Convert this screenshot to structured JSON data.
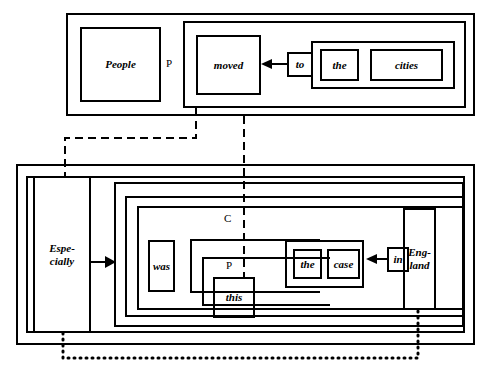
{
  "diagram": {
    "style": {
      "line_color": "#000000",
      "background": "#ffffff",
      "text_color": "#000000"
    },
    "top_clause": {
      "words": {
        "people": "People",
        "moved": "moved",
        "to": "to",
        "the": "the",
        "cities": "cities"
      },
      "categories": {
        "subject_p": "P"
      }
    },
    "bottom_clause": {
      "words": {
        "especially": "Espe-\ncially",
        "was": "was",
        "this": "this",
        "the": "the",
        "case": "case",
        "in": "in",
        "england": "Eng-\nland"
      },
      "categories": {
        "c": "C",
        "p": "P"
      }
    },
    "connectors": {
      "dashed_1": "dashed link from moved-phrase down-left to Especially",
      "dashed_2": "dashed link from top clause down to this",
      "dotted_1": "dotted link from Especially bottom to England bottom"
    }
  }
}
